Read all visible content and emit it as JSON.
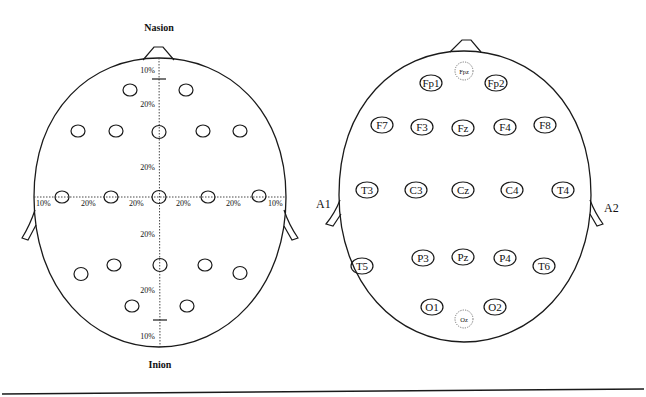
{
  "left_diagram": {
    "top_label": "Nasion",
    "bottom_label": "Inion",
    "vertical_percentages": [
      "10%",
      "20%",
      "20%",
      "20%",
      "20%",
      "10%"
    ],
    "horizontal_percentages": [
      "10%",
      "20%",
      "20%",
      "20%",
      "20%",
      "10%"
    ],
    "electrode_count": 19
  },
  "right_diagram": {
    "left_ear_label": "A1",
    "right_ear_label": "A2",
    "electrodes": {
      "fpz": "Fpz",
      "fp1": "Fp1",
      "fp2": "Fp2",
      "f7": "F7",
      "f3": "F3",
      "fz": "Fz",
      "f4": "F4",
      "f8": "F8",
      "t3": "T3",
      "c3": "C3",
      "cz": "Cz",
      "c4": "C4",
      "t4": "T4",
      "t5": "T5",
      "p3": "P3",
      "pz": "Pz",
      "p4": "P4",
      "t6": "T6",
      "o1": "O1",
      "o2": "O2",
      "oz": "Oz"
    }
  },
  "colors": {
    "line": "#1a1a1a",
    "dashed_electrode": "#666666",
    "background": "#ffffff"
  }
}
